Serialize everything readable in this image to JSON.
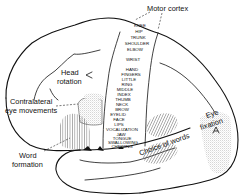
{
  "diagram": {
    "labels": {
      "motor_cortex": "Motor cortex",
      "head_rotation_line1": "Head",
      "head_rotation_line2": "rotation",
      "contralateral_line1": "Contralateral",
      "contralateral_line2": "eye movements",
      "word_formation_line1": "Word",
      "word_formation_line2": "formation",
      "choice_of_words": "Choice of words",
      "eye_fixation_line1": "Eye",
      "eye_fixation_line2": "fixation"
    },
    "motor_strip": [
      "KNEE",
      "HIP",
      "TRUNK",
      "SHOULDER",
      "ELBOW",
      "WRIST",
      "HAND",
      "FINGERS",
      "LITTLE",
      "RING",
      "MIDDLE",
      "INDEX",
      "THUMB",
      "NECK",
      "BROW",
      "EYELID",
      "FACE",
      "LIPS",
      "VOCALIZATION",
      "JAW",
      "TONGUE",
      "SWALLOWING",
      "CHEWING"
    ],
    "colors": {
      "line": "#111111",
      "stipple": "#bdbdbd",
      "hatch": "#555555",
      "background": "#ffffff"
    }
  }
}
